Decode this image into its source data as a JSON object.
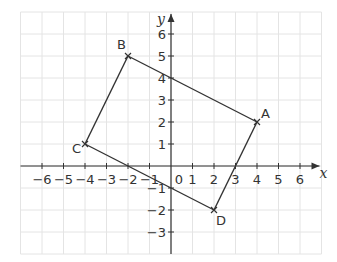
{
  "figure": {
    "type": "coordinate-grid",
    "x_axis": {
      "label": "x",
      "min": -7,
      "max": 7,
      "tick_labels": [
        "-6",
        "-5",
        "-4",
        "-3",
        "-2",
        "-1",
        "0",
        "1",
        "2",
        "3",
        "4",
        "5",
        "6"
      ]
    },
    "y_axis": {
      "label": "y",
      "min": -4,
      "max": 7,
      "tick_labels": [
        "6",
        "5",
        "4",
        "3",
        "2",
        "1",
        "-1",
        "-2",
        "-3"
      ]
    },
    "origin_label": "0",
    "grid": true,
    "colors": {
      "ink": "#333333",
      "grid": "#e4e4e4",
      "background": "#ffffff"
    }
  },
  "shape": {
    "name": "quadrilateral ABDC",
    "vertices": [
      {
        "label": "A",
        "x": 4,
        "y": 2
      },
      {
        "label": "B",
        "x": -2,
        "y": 5
      },
      {
        "label": "C",
        "x": -4,
        "y": 1
      },
      {
        "label": "D",
        "x": 2,
        "y": -2
      }
    ],
    "edges": [
      [
        "B",
        "A"
      ],
      [
        "A",
        "D"
      ],
      [
        "D",
        "C"
      ],
      [
        "C",
        "B"
      ]
    ]
  }
}
